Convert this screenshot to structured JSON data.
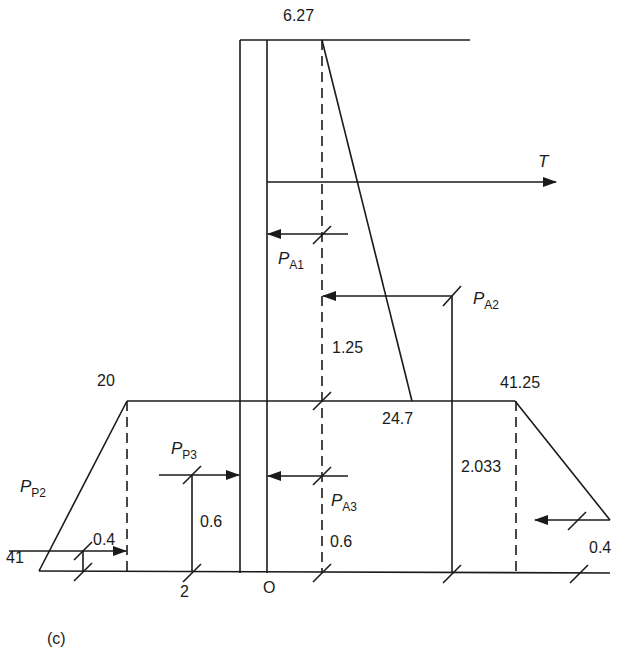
{
  "figure": {
    "caption": "(c)",
    "type": "sheet-pile-wall-pressure-diagram"
  },
  "labels": {
    "top_pressure": "6.27",
    "tie_force": "T",
    "left_top_pressure": "20",
    "right_top_pressure": "41.25",
    "left_base_pressure": "41",
    "dredge_level_pressure": "24.7",
    "pa2_lever": "1.25",
    "right_lever": "2.033",
    "pa3_lever": "0.6",
    "pp3_lever": "0.6",
    "pp2_lever": "0.4",
    "right_bottom_lever": "0.4",
    "bottom_point_2": "2",
    "origin": "O"
  },
  "forces": {
    "pa1": {
      "symbol": "P",
      "subscript": "A1"
    },
    "pa2": {
      "symbol": "P",
      "subscript": "A2"
    },
    "pa3": {
      "symbol": "P",
      "subscript": "A3"
    },
    "pp2": {
      "symbol": "P",
      "subscript": "P2"
    },
    "pp3": {
      "symbol": "P",
      "subscript": "P3"
    }
  },
  "colors": {
    "line": "#1a1a1a",
    "background": "#ffffff"
  }
}
